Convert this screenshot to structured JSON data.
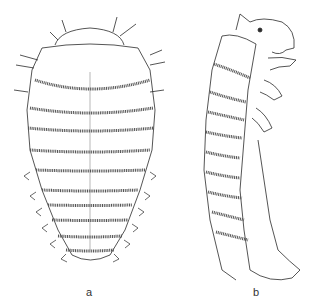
{
  "figure": {
    "panels": [
      {
        "id": "a",
        "label": "a",
        "view": "dorsal"
      },
      {
        "id": "b",
        "label": "b",
        "view": "lateral"
      }
    ],
    "colors": {
      "ink": "#2a2a2a",
      "band": "#555555",
      "background": "#ffffff"
    }
  }
}
